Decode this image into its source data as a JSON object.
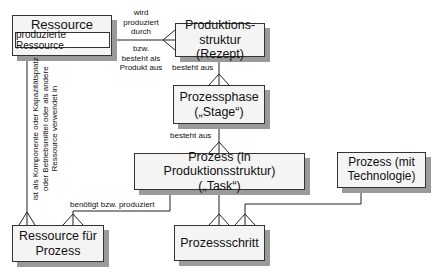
{
  "entities": {
    "ressource": {
      "title": "Ressource",
      "attribute": "produzierte Ressource"
    },
    "produktionsstruktur": {
      "line1": "Produktions-",
      "line2": "struktur (Rezept)"
    },
    "prozessphase": {
      "line1": "Prozessphase",
      "line2": "(„Stage“)"
    },
    "prozess_task": {
      "line1": "Prozess (in Produktionsstruktur)",
      "line2": "(„Task“)"
    },
    "prozess_technologie": {
      "line1": "Prozess (mit",
      "line2": "Technologie)"
    },
    "ressource_fuer_prozess": {
      "line1": "Ressource für",
      "line2": "Prozess"
    },
    "prozessschritt": {
      "line1": "Prozessschritt"
    }
  },
  "relations": {
    "ressource_produktion_top": [
      "wird",
      "produziert",
      "durch"
    ],
    "ressource_produktion_bottom": [
      "bzw.",
      "besteht als",
      "Produkt aus"
    ],
    "struktur_phase": "besteht aus",
    "phase_task": "besteht aus",
    "task_ressource": "benötigt bzw. produziert",
    "ressource_verwendung": [
      "ist als Komponente oder Kapazitätsplatz",
      "oder Betriebsmittel oder als andere",
      "Ressource verwendet in"
    ]
  }
}
